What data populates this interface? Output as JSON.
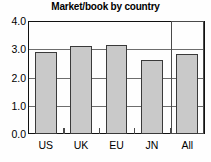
{
  "chart_data": {
    "type": "bar",
    "title": "Market/book by country",
    "xlabel": "",
    "ylabel": "",
    "categories": [
      "US",
      "UK",
      "EU",
      "JN",
      "All"
    ],
    "values": [
      2.9,
      3.1,
      3.15,
      2.63,
      2.82
    ],
    "ylim": [
      0.0,
      4.0
    ],
    "yticks": [
      "0.0",
      "1.0",
      "2.0",
      "3.0",
      "4.0"
    ],
    "ytick_values": [
      0.0,
      1.0,
      2.0,
      3.0,
      4.0
    ],
    "grid": true,
    "legend": null,
    "annotations": [
      {
        "name": "all-group-highlight-box",
        "category": "All",
        "top_value": 4.0,
        "bottom_value": 0.0
      }
    ],
    "colors": {
      "bar_fill": "#c9c9c9",
      "bar_border": "#3a3a3a",
      "gridline": "#6d6d6d",
      "axis": "#111111",
      "text": "#000000",
      "background": "#fefefe"
    }
  }
}
